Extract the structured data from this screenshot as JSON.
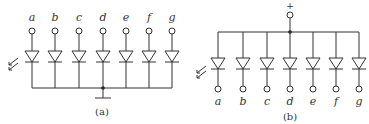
{
  "diagrams": [
    {
      "id": "a",
      "caption": "(a)",
      "configuration": "common-cathode",
      "terminals": [
        "a",
        "b",
        "c",
        "d",
        "e",
        "f",
        "g"
      ],
      "common_node": "ground",
      "x_positions": [
        32,
        55,
        79,
        103,
        126,
        149,
        172
      ]
    },
    {
      "id": "b",
      "caption": "(b)",
      "configuration": "common-anode",
      "terminals": [
        "a",
        "b",
        "c",
        "d",
        "e",
        "f",
        "g"
      ],
      "common_node": "+",
      "supply_label": "+",
      "x_positions": [
        218,
        243,
        267,
        290,
        313,
        336,
        359
      ]
    }
  ],
  "colors": {
    "line": "#333333",
    "background": "#ffffff"
  }
}
